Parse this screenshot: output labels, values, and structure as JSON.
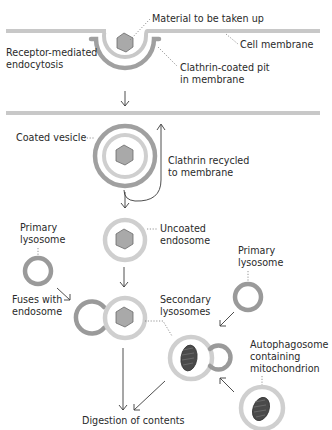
{
  "diagram": {
    "colors": {
      "membrane": "#c8c8c8",
      "clathrin_coat": "#9d9d9d",
      "endosome_membrane": "#cfcfcf",
      "lysosome_membrane": "#9a9a9a",
      "cargo_fill": "#a9a9a9",
      "cargo_stroke": "#6b6b6b",
      "mitochondrion_fill": "#4a4a4a",
      "text": "#2a2a2a"
    },
    "labels": {
      "material": "Material to be taken up",
      "cell_membrane": "Cell membrane",
      "process_line1": "Receptor-mediated",
      "process_line2": "endocytosis",
      "pit_line1": "Clathrin-coated pit",
      "pit_line2": "in membrane",
      "coated_vesicle": "Coated vesicle",
      "recycle_line1": "Clathrin recycled",
      "recycle_line2": "to membrane",
      "primary_lysosome_left_line1": "Primary",
      "primary_lysosome_left_line2": "lysosome",
      "uncoated_line1": "Uncoated",
      "uncoated_line2": "endosome",
      "primary_lysosome_right_line1": "Primary",
      "primary_lysosome_right_line2": "lysosome",
      "fuses_line1": "Fuses with",
      "fuses_line2": "endosome",
      "secondary_line1": "Secondary",
      "secondary_line2": "lysosomes",
      "autophagosome_line1": "Autophagosome",
      "autophagosome_line2": "containing",
      "autophagosome_line3": "mitochondrion",
      "digestion": "Digestion of contents"
    }
  }
}
